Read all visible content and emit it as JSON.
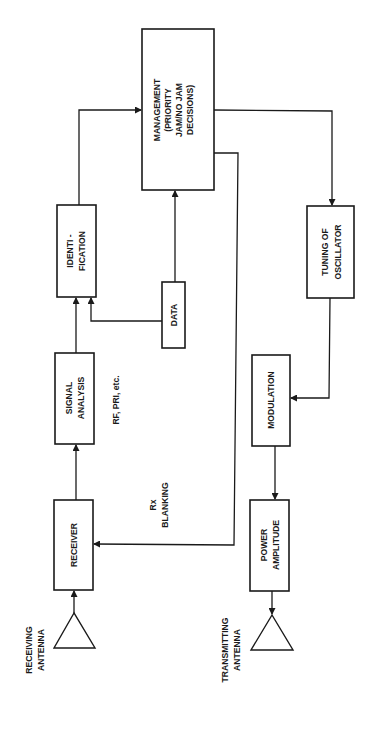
{
  "diagram": {
    "orientation": "rotated-90-ccw",
    "blocks": {
      "management": {
        "lines": [
          "MANAGEMENT",
          "(PRIORITY",
          "JAM/NO JAM",
          "DECISIONS)"
        ]
      },
      "identification": {
        "lines": [
          "IDENTI  -",
          "FICATION"
        ]
      },
      "data": {
        "lines": [
          "DATA"
        ]
      },
      "signal_analysis": {
        "lines": [
          "SIGNAL",
          "ANALYSIS"
        ]
      },
      "receiver": {
        "lines": [
          "RECEIVER"
        ]
      },
      "tuning": {
        "lines": [
          "TUNING OF",
          "OSCILLATOR"
        ]
      },
      "modulation": {
        "lines": [
          "MODULATION"
        ]
      },
      "power": {
        "lines": [
          "POWER",
          "AMPLITUDE"
        ]
      }
    },
    "labels": {
      "rf_pri": "RF, PRI, etc.",
      "rx_blanking": [
        "Rx",
        "BLANKING"
      ],
      "receiving_antenna": [
        "RECEIVING",
        "ANTENNA"
      ],
      "transmitting_antenna": [
        "TRANSMITTING",
        "ANTENNA"
      ]
    },
    "colors": {
      "stroke": "#1a1a1a",
      "background": "#ffffff"
    }
  }
}
